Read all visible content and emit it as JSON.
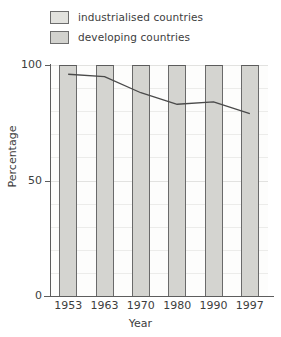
{
  "chart_data": {
    "type": "bar",
    "title": "",
    "xlabel": "Year",
    "ylabel": "Percentage",
    "categories": [
      "1953",
      "1963",
      "1970",
      "1980",
      "1990",
      "1997"
    ],
    "ylim": [
      0,
      100
    ],
    "yticks": [
      0,
      50,
      100
    ],
    "ytick_labels": [
      "0",
      "50",
      "100"
    ],
    "grid": true,
    "legend_position": "top-left",
    "series": [
      {
        "name": "industrialised countries",
        "render": "area-above-line",
        "color": "#e2e2de",
        "values": [
          4,
          5,
          12,
          17,
          16,
          21
        ]
      },
      {
        "name": "developing countries",
        "render": "bar-below-line",
        "color": "#d2d2ce",
        "values": [
          96,
          95,
          88,
          83,
          84,
          79
        ]
      }
    ],
    "overlay_line": {
      "name": "developing countries share",
      "color": "#4a4a4a",
      "x": [
        "1953",
        "1963",
        "1970",
        "1980",
        "1990",
        "1997"
      ],
      "values": [
        96,
        95,
        88,
        83,
        84,
        79
      ]
    }
  },
  "legend": {
    "items": [
      {
        "label": "industrialised countries",
        "swatch_class": "ind",
        "color": "#e2e2de"
      },
      {
        "label": "developing countries",
        "swatch_class": "dev",
        "color": "#d2d2ce"
      }
    ]
  },
  "axes": {
    "y_title": "Percentage",
    "x_title": "Year"
  }
}
